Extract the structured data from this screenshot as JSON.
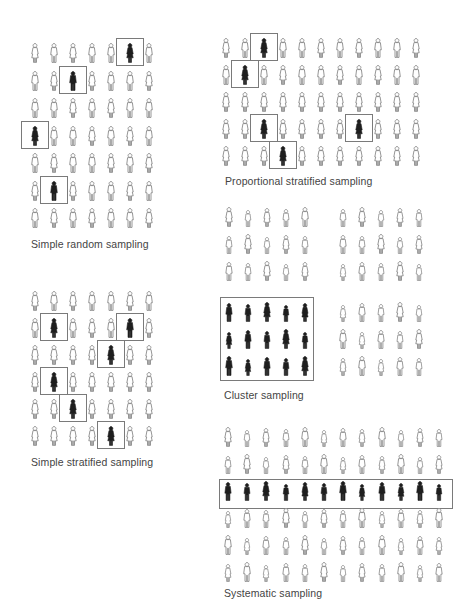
{
  "panels": {
    "simple_random": {
      "caption": "Simple random sampling",
      "grid": {
        "cols": 7,
        "rows": 7
      },
      "selected": [
        [
          0,
          5
        ],
        [
          1,
          2
        ],
        [
          3,
          0
        ],
        [
          5,
          1
        ]
      ]
    },
    "simple_stratified": {
      "caption": "Simple stratified sampling",
      "grid": {
        "cols": 7,
        "rows": 6
      },
      "selected": [
        [
          1,
          1
        ],
        [
          1,
          5
        ],
        [
          2,
          4
        ],
        [
          3,
          1
        ],
        [
          4,
          2
        ],
        [
          5,
          4
        ]
      ]
    },
    "proportional_stratified": {
      "caption": "Proportional stratified sampling",
      "grid": {
        "cols": 11,
        "rows": 5
      },
      "selected": [
        [
          0,
          2
        ],
        [
          1,
          1
        ],
        [
          3,
          2
        ],
        [
          3,
          7
        ],
        [
          4,
          3
        ]
      ]
    },
    "cluster": {
      "caption": "Cluster sampling",
      "clusters": [
        {
          "position": "top-left",
          "cols": 5,
          "rows": 3,
          "selected": false
        },
        {
          "position": "top-right",
          "cols": 5,
          "rows": 3,
          "selected": false
        },
        {
          "position": "bottom-left",
          "cols": 5,
          "rows": 3,
          "selected": true
        },
        {
          "position": "bottom-right",
          "cols": 5,
          "rows": 3,
          "selected": false
        }
      ]
    },
    "systematic": {
      "caption": "Systematic sampling",
      "grid": {
        "cols": 12,
        "rows": 6
      },
      "selected_row": 2
    }
  },
  "colors": {
    "outline_figure": "#8a8a8a",
    "selected_figure": "#1e1e1e",
    "selection_box": "#7a7a7a",
    "caption_text": "#444444",
    "background": "#ffffff"
  }
}
